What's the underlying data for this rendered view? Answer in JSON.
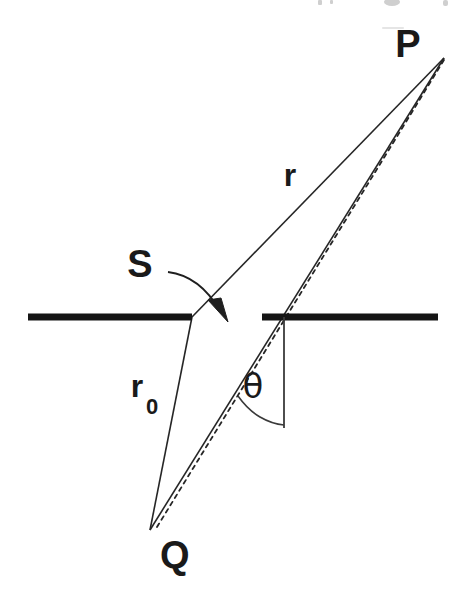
{
  "figure": {
    "title": "",
    "background_color": "#ffffff",
    "ink_color": "#1a1a1a",
    "barrier_color": "#151515",
    "width": 467,
    "height": 595
  },
  "labels": {
    "point_p": "P",
    "point_q": "Q",
    "slit_s": "S",
    "distance_r": "r",
    "distance_r0_base": "r",
    "distance_r0_subscript": "0",
    "angle_theta": "θ"
  },
  "geometry": {
    "point_p": {
      "x": 444,
      "y": 58
    },
    "point_q": {
      "x": 150,
      "y": 530
    },
    "slit_left_edge": {
      "x": 192,
      "y": 317
    },
    "slit_right_edge": {
      "x": 262,
      "y": 317
    },
    "barrier_y": 317,
    "barrier_left": {
      "x1": 28,
      "x2": 192
    },
    "barrier_right": {
      "x1": 262,
      "x2": 438
    },
    "normal_line": {
      "x": 284,
      "y_top": 317,
      "y_bottom": 428
    },
    "angle_arc_radius": 108,
    "theta_degrees": 37
  },
  "label_positions": {
    "point_p": {
      "x": 408,
      "y": 57
    },
    "point_q": {
      "x": 160,
      "y": 568
    },
    "slit_s": {
      "x": 140,
      "y": 277
    },
    "distance_r": {
      "x": 290,
      "y": 186
    },
    "distance_r0": {
      "x": 137,
      "y": 397
    },
    "distance_r0_subscript": {
      "x": 152,
      "y": 412
    },
    "angle_theta": {
      "x": 253,
      "y": 397
    }
  },
  "elements": {
    "rays": [
      {
        "name": "ray-r0-q-to-slit-left",
        "from": "point_q",
        "to": "slit_left_edge",
        "style": "solid"
      },
      {
        "name": "ray-slit-left-to-p",
        "from": "slit_left_edge",
        "to": "point_p",
        "style": "solid"
      },
      {
        "name": "ray-q-to-p-through-slit-right",
        "from": "point_q",
        "to": "point_p",
        "style": "solid"
      },
      {
        "name": "ray-q-to-p-dashed",
        "from": "point_q",
        "to": "point_p",
        "style": "dashed"
      }
    ],
    "pointer": {
      "name": "s-pointer-arrow",
      "from": {
        "x": 168,
        "y": 272
      },
      "to": {
        "x": 228,
        "y": 320
      }
    }
  }
}
